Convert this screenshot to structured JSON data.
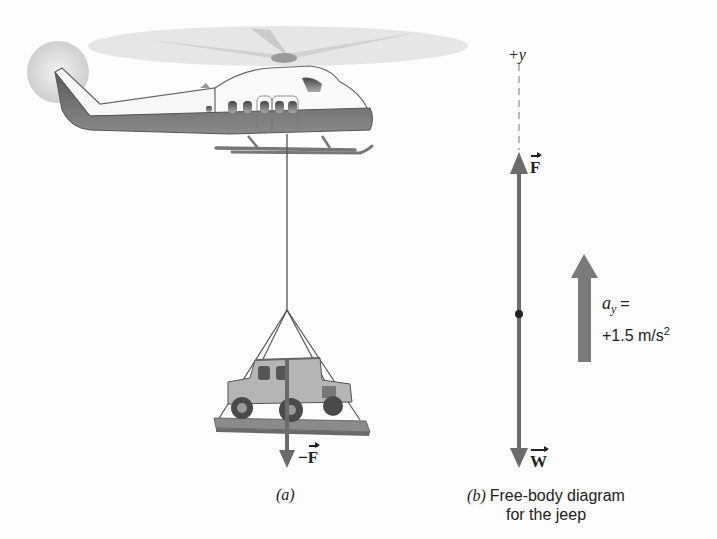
{
  "figure": {
    "part_a": {
      "caption": "(a)",
      "force_label_prefix": "−",
      "force_label": "F"
    },
    "part_b": {
      "axis_label": "+y",
      "upward_force_label": "F",
      "downward_force_label": "W",
      "caption_letter": "(b)",
      "caption_line1": "Free-body diagram",
      "caption_line2": "for the jeep",
      "acceleration": {
        "symbol": "a",
        "subscript": "y",
        "equals": "=",
        "value": "+1.5 m/s",
        "exponent": "2"
      }
    },
    "colors": {
      "arrow": "#6b6b6b",
      "accel_arrow": "#7a7a7a",
      "fuselage_dark": "#6e6e6e",
      "rotor": "#d9d9d9",
      "text": "#222222"
    }
  }
}
